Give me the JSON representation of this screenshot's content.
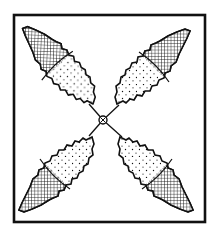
{
  "illustration": {
    "subject": "four-leaf cross ornament in square frame",
    "frame": {
      "x": 14,
      "y": 15,
      "width": 191,
      "height": 207
    },
    "center": {
      "x": 103,
      "y": 120
    },
    "leaves": [
      {
        "name": "top-left",
        "tip_x": 28,
        "tip_y": 30
      },
      {
        "name": "top-right",
        "tip_x": 195,
        "tip_y": 33
      },
      {
        "name": "bottom-left",
        "tip_x": 24,
        "tip_y": 212
      },
      {
        "name": "bottom-right",
        "tip_x": 188,
        "tip_y": 212
      }
    ],
    "fills": {
      "body": "stipple",
      "tip": "crosshatch"
    },
    "colors": {
      "ink": "#111111",
      "paper": "#ffffff"
    }
  }
}
